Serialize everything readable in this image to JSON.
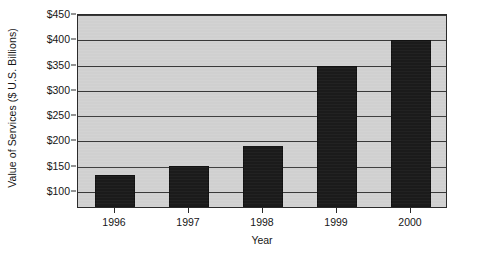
{
  "chart_data": {
    "type": "bar",
    "title": "",
    "xlabel": "Year",
    "ylabel": "Value of Services ($ U.S. Billions)",
    "categories": [
      "1996",
      "1997",
      "1998",
      "1999",
      "2000"
    ],
    "values": [
      130,
      148,
      186,
      345,
      396
    ],
    "ylim": [
      66,
      450
    ],
    "yticks": [
      100,
      150,
      200,
      250,
      300,
      350,
      400,
      450
    ],
    "ytick_labels": [
      "$100",
      "$150",
      "$200",
      "$250",
      "$300",
      "$350",
      "$400",
      "$450"
    ],
    "grid": true,
    "legend": null,
    "colors": {
      "bar": "#1b1b1b",
      "plot_background": "#d2d2d2",
      "gridline": "#3a3a3a",
      "axis": "#2b2b2b",
      "text": "#161616",
      "page_background": "#ffffff"
    }
  }
}
